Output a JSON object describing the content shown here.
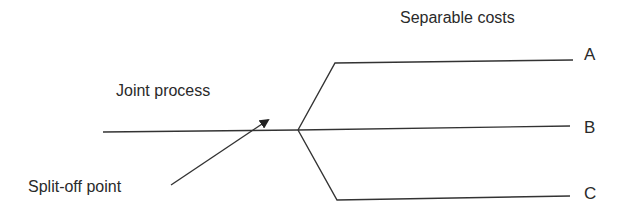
{
  "diagram": {
    "type": "joint-process-split-off",
    "labels": {
      "separable_costs": "Separable costs",
      "joint_process": "Joint process",
      "split_off_point": "Split-off point"
    },
    "products": [
      {
        "label": "A"
      },
      {
        "label": "B"
      },
      {
        "label": "C"
      }
    ],
    "colors": {
      "line": "#333333",
      "text": "#2a2a2a",
      "background": "#ffffff"
    }
  }
}
